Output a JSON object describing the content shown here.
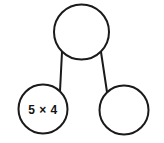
{
  "diagram": {
    "type": "number-bond",
    "background_color": "#ffffff",
    "stroke_color": "#1a1a1a",
    "text_color": "#141414",
    "nodes": [
      {
        "id": "whole",
        "role": "whole",
        "label": "",
        "cx": 81.5,
        "cy": 32,
        "r": 27.5,
        "empty": true
      },
      {
        "id": "part-left",
        "role": "part",
        "label": "5 × 4",
        "cx": 43,
        "cy": 109,
        "r": 24.5,
        "empty": false
      },
      {
        "id": "part-right",
        "role": "part",
        "label": "",
        "cx": 124,
        "cy": 110,
        "r": 24.5,
        "empty": true
      }
    ],
    "connectors": [
      {
        "id": "whole-to-left",
        "from": "whole",
        "to": "part-left",
        "x1": 62,
        "y1": 52,
        "x2": 60,
        "y2": 91
      },
      {
        "id": "whole-to-right",
        "from": "whole",
        "to": "part-right",
        "x1": 101,
        "y1": 52,
        "x2": 107,
        "y2": 92
      }
    ]
  }
}
